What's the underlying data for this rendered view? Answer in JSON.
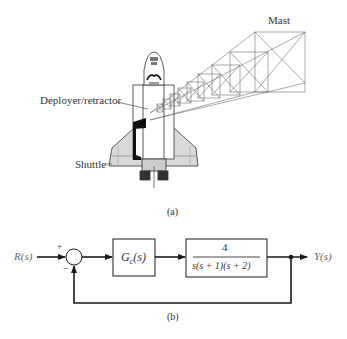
{
  "figure_a": {
    "caption": "(a)",
    "labels": {
      "mast": "Mast",
      "deployer": "Deployer/retractor",
      "shuttle": "Shuttle"
    }
  },
  "figure_b": {
    "caption": "(b)",
    "input": "R(s)",
    "output": "Y(s)",
    "summing_junction": {
      "plus_sign": "+",
      "minus_sign": "−"
    },
    "controller": {
      "name": "G",
      "subscript": "c",
      "arg": "(s)"
    },
    "plant": {
      "numerator": "4",
      "denominator": "s(s + 1)(s + 2)"
    },
    "feedback": "unity negative"
  },
  "colors": {
    "line": "#1a1a1a",
    "text": "#333333",
    "signal_text": "#666666",
    "shuttle_fill": "#d9d9d9"
  }
}
